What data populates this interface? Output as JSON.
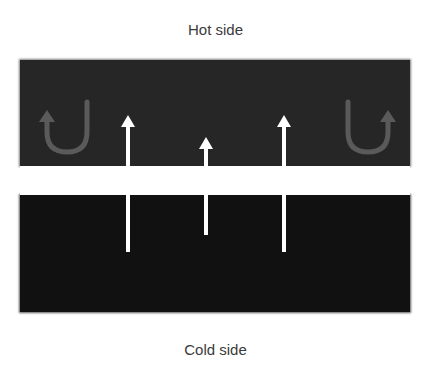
{
  "diagram": {
    "top_label": "Hot side",
    "bottom_label": "Cold side",
    "colors": {
      "hot_region": "#262626",
      "cold_region": "#111111",
      "arrow": "#ffffff",
      "return_arrow": "#5a5a5a",
      "label_text": "#3a3a3a"
    },
    "arrows": [
      {
        "name": "left-up-arrow",
        "x": 128,
        "from_y": 252,
        "to_y": 116
      },
      {
        "name": "middle-up-arrow",
        "x": 206,
        "from_y": 235,
        "to_y": 138
      },
      {
        "name": "right-up-arrow",
        "x": 284,
        "from_y": 252,
        "to_y": 116
      }
    ],
    "return_arrows": [
      {
        "name": "left-return-arrow",
        "direction": "left"
      },
      {
        "name": "right-return-arrow",
        "direction": "right"
      }
    ]
  }
}
